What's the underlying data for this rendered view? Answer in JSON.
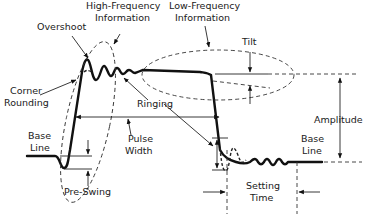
{
  "labels": {
    "high_frequency": [
      "High-Frequency",
      "Information"
    ],
    "low_frequency": [
      "Low-Frequency",
      "Information"
    ],
    "overshoot": "Overshoot",
    "corner_rounding": [
      "Corner",
      "Rounding"
    ],
    "tilt": "Tilt",
    "ringing": "Ringing",
    "amplitude": "Amplitude",
    "base_line_left": [
      "Base",
      "Line"
    ],
    "base_line_right": [
      "Base",
      "Line"
    ],
    "pulse_width": [
      "Pulse",
      "Width"
    ],
    "pre_swing": "Pre-Swing",
    "settling_time": [
      "Setting",
      "Time"
    ]
  },
  "colors": {
    "stroke": "#111111",
    "background": "#ffffff"
  }
}
